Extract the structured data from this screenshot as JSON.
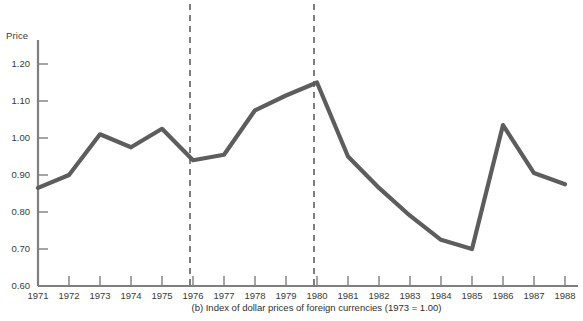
{
  "figure": {
    "caption": "(b)  Index of dollar prices of foreign currencies (1973 = 1.00)",
    "y_axis_title": "Price"
  },
  "chart_data": {
    "type": "line",
    "title": "",
    "subtitle": "",
    "xlabel": "",
    "ylabel": "Price",
    "ylim": [
      0.6,
      1.2
    ],
    "xlim": [
      1971,
      1988
    ],
    "grid": false,
    "legend": "none",
    "line_color": "#5d5d5d",
    "axis_color": "#7a7a7a",
    "categories": [
      "1971",
      "1972",
      "1973",
      "1974",
      "1975",
      "1976",
      "1977",
      "1978",
      "1979",
      "1980",
      "1981",
      "1982",
      "1983",
      "1984",
      "1985",
      "1986",
      "1987",
      "1988"
    ],
    "x": [
      1971,
      1972,
      1973,
      1974,
      1975,
      1976,
      1977,
      1978,
      1979,
      1980,
      1981,
      1982,
      1983,
      1984,
      1985,
      1986,
      1987,
      1988
    ],
    "values": [
      0.865,
      0.9,
      1.01,
      0.975,
      1.025,
      0.94,
      0.955,
      1.075,
      1.115,
      1.15,
      0.95,
      0.865,
      0.79,
      0.725,
      0.7,
      1.035,
      0.905,
      0.875
    ],
    "series": [
      {
        "name": "Index of dollar prices of foreign currencies",
        "values": [
          0.865,
          0.9,
          1.01,
          0.975,
          1.025,
          0.94,
          0.955,
          1.075,
          1.115,
          1.15,
          0.95,
          0.865,
          0.79,
          0.725,
          0.7,
          1.035,
          0.905,
          0.875
        ]
      }
    ],
    "ytick_labels": [
      "1.20",
      "1.10",
      "1.00",
      "0.90",
      "0.80",
      "0.70",
      "0.60"
    ],
    "ytick_values": [
      1.2,
      1.1,
      1.0,
      0.9,
      0.8,
      0.7,
      0.6
    ],
    "xtick_labels": [
      "1971",
      "1972",
      "1973",
      "1974",
      "1975",
      "1976",
      "1977",
      "1978",
      "1979",
      "1980",
      "1981",
      "1982",
      "1983",
      "1984",
      "1985",
      "1986",
      "1987",
      "1988"
    ],
    "annotations": [
      {
        "name": "vertical-dashed-1976",
        "type": "vline",
        "x": 1976
      },
      {
        "name": "vertical-dashed-1980",
        "type": "vline",
        "x": 1980
      }
    ]
  }
}
